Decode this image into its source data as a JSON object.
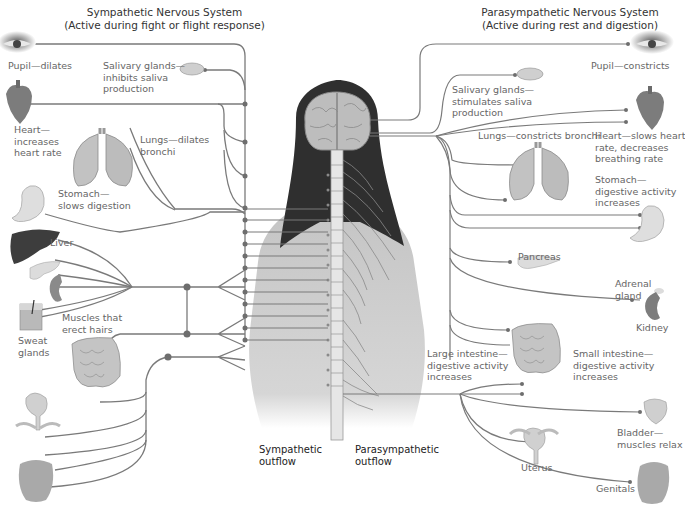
{
  "diagram": {
    "sympathetic": {
      "title": "Sympathetic Nervous System",
      "subtitle": "(Active during fight or flight response)",
      "outflow_label_1": "Sympathetic",
      "outflow_label_2": "outflow",
      "organs": {
        "pupil": "Pupil—dilates",
        "salivary_1": "Salivary glands—",
        "salivary_2": "inhibits saliva",
        "salivary_3": "production",
        "heart_1": "Heart—",
        "heart_2": "increases",
        "heart_3": "heart rate",
        "lungs_1": "Lungs—dilates",
        "lungs_2": "bronchi",
        "stomach_1": "Stomach—",
        "stomach_2": "slows digestion",
        "liver": "Liver",
        "muscles_1": "Muscles that",
        "muscles_2": "erect hairs",
        "sweat_1": "Sweat",
        "sweat_2": "glands"
      }
    },
    "parasympathetic": {
      "title": "Parasympathetic Nervous System",
      "subtitle": "(Active during rest and digestion)",
      "outflow_label_1": "Parasympathetic",
      "outflow_label_2": "outflow",
      "organs": {
        "pupil": "Pupil—constricts",
        "salivary_1": "Salivary glands—",
        "salivary_2": "stimulates saliva",
        "salivary_3": "production",
        "lungs": "Lungs—constricts bronchi",
        "heart_1": "Heart—slows heart",
        "heart_2": "rate, decreases",
        "heart_3": "breathing rate",
        "stomach_1": "Stomach—",
        "stomach_2": "digestive activity",
        "stomach_3": "increases",
        "pancreas": "Pancreas",
        "adrenal_1": "Adrenal",
        "adrenal_2": "gland",
        "kidney": "Kidney",
        "large_int_1": "Large intestine—",
        "large_int_2": "digestive activity",
        "large_int_3": "increases",
        "small_int_1": "Small intestine—",
        "small_int_2": "digestive activity",
        "small_int_3": "increases",
        "bladder_1": "Bladder—",
        "bladder_2": "muscles relax",
        "uterus": "Uterus",
        "genitals": "Genitals"
      }
    },
    "colors": {
      "nerve_line": "#7a7a7a",
      "node": "#6e6e6e",
      "skin": "#c9c9c9",
      "hair": "#2e2e2e",
      "organ_gray": "#a9a9a9",
      "liver": "#3d3d3d"
    }
  }
}
